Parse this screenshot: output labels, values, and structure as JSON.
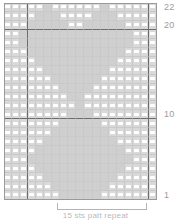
{
  "chart_data": {
    "type": "heatmap",
    "title": "",
    "xlabel": "15 sts patt repeat",
    "ylabel": "",
    "grid": true,
    "legend": "none",
    "columns": 19,
    "rows": 22,
    "row_labels_visible": [
      "22",
      "20",
      "10",
      "1"
    ],
    "row_label_rows": [
      22,
      20,
      10,
      1
    ],
    "symbols": {
      "dash": "white horizontal dash (purl stitch)",
      "blank": "empty cell (knit stitch)"
    },
    "heavy_line_rows": [
      20,
      10
    ],
    "heavy_line_columns": [
      3,
      18
    ],
    "repeat_span_columns": [
      5,
      15
    ],
    "cells": [
      "dash,dash,dash,dash,dash,blank,dash,dash,dash,dash,dash,dash,blank,dash,dash,dash,dash,dash,dash",
      "dash,dash,dash,dash,blank,blank,blank,dash,dash,dash,dash,blank,blank,blank,dash,dash,dash,dash,dash",
      "dash,dash,dash,blank,blank,blank,blank,blank,dash,dash,blank,blank,blank,blank,blank,dash,dash,dash,dash",
      "dash,dash,blank,blank,blank,blank,blank,blank,blank,blank,blank,blank,blank,blank,blank,blank,dash,dash,dash",
      "dash,dash,blank,blank,blank,blank,blank,blank,blank,blank,blank,blank,blank,blank,blank,blank,dash,dash,dash",
      "dash,dash,dash,blank,blank,blank,blank,blank,blank,blank,blank,blank,blank,blank,blank,dash,dash,dash,dash",
      "dash,dash,dash,dash,blank,blank,blank,blank,blank,blank,blank,blank,blank,blank,dash,dash,dash,dash,dash",
      "dash,dash,dash,dash,dash,blank,blank,blank,blank,blank,blank,blank,blank,dash,dash,dash,dash,dash,dash",
      "dash,dash,dash,dash,dash,dash,blank,blank,blank,blank,blank,blank,dash,dash,dash,dash,dash,dash,dash",
      "dash,dash,dash,dash,dash,dash,dash,blank,blank,blank,blank,dash,dash,dash,dash,dash,dash,dash,dash",
      "dash,dash,dash,dash,dash,dash,dash,dash,blank,blank,dash,dash,dash,dash,dash,dash,dash,dash,dash",
      "dash,dash,dash,dash,dash,dash,dash,dash,dash,blank,dash,dash,dash,dash,dash,dash,dash,dash,dash",
      "dash,dash,dash,dash,dash,dash,dash,dash,blank,blank,blank,dash,dash,dash,dash,dash,dash,dash,dash",
      "dash,dash,dash,dash,dash,dash,dash,blank,blank,blank,blank,blank,dash,dash,dash,dash,dash,dash,dash",
      "dash,dash,dash,dash,dash,dash,blank,blank,blank,blank,blank,blank,blank,dash,dash,dash,dash,dash,dash",
      "dash,dash,dash,dash,dash,blank,blank,blank,blank,blank,blank,blank,blank,blank,dash,dash,dash,dash,dash",
      "dash,dash,dash,dash,blank,blank,blank,blank,blank,blank,blank,blank,blank,blank,blank,dash,dash,dash,dash",
      "dash,dash,dash,blank,blank,blank,blank,blank,blank,blank,blank,blank,blank,blank,blank,blank,dash,dash,dash",
      "dash,dash,dash,dash,blank,blank,blank,blank,blank,blank,blank,blank,blank,blank,blank,dash,dash,dash,dash",
      "dash,dash,dash,dash,dash,blank,blank,blank,blank,blank,blank,blank,blank,blank,dash,dash,dash,dash,dash",
      "dash,dash,dash,dash,dash,dash,blank,blank,blank,blank,blank,blank,blank,dash,dash,dash,dash,dash,dash",
      "dash,dash,dash,dash,dash,dash,dash,blank,blank,blank,blank,blank,dash,dash,dash,dash,dash,dash,dash"
    ]
  },
  "labels": {
    "row_22": "22",
    "row_20": "20",
    "row_10": "10",
    "row_1": "1"
  },
  "caption": {
    "repeat_text": "15 sts patt repeat"
  },
  "colors": {
    "cell_fill": "#d9d9d9",
    "cell_blank": "#cfcfcf",
    "symbol": "#ffffff",
    "gridline": "#c9c9c9",
    "heavy_gridline": "#6d6d6d",
    "label_text": "#9c9c9c",
    "caption_text": "#b9b9b9"
  }
}
